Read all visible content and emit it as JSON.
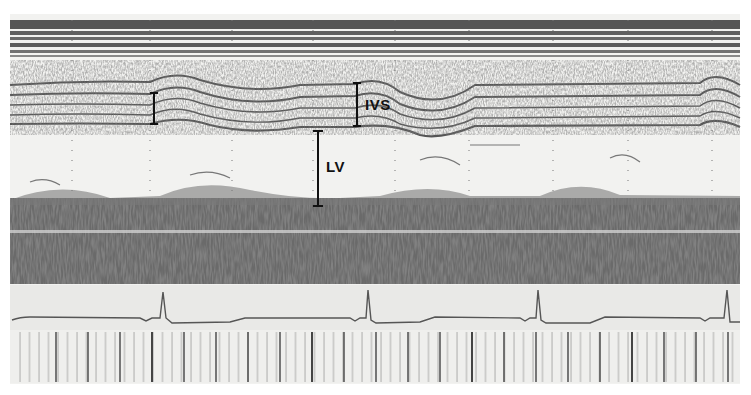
{
  "image": {
    "kind": "M-mode echocardiogram",
    "background": "#f2f2f0",
    "ink": "#3a3a3a"
  },
  "labels": {
    "ivs": "IVS",
    "lv": "LV"
  },
  "calipers": [
    {
      "name": "ivs-caliper-left",
      "x": 154,
      "y1": 93,
      "y2": 124
    },
    {
      "name": "ivs-caliper",
      "x": 357,
      "y1": 83,
      "y2": 126
    },
    {
      "name": "lv-caliper",
      "x": 318,
      "y1": 131,
      "y2": 206
    }
  ],
  "regions": {
    "near_field_bands": {
      "y1": 18,
      "y2": 58
    },
    "septum_echoes": {
      "y1": 60,
      "y2": 135
    },
    "lv_cavity": {
      "y1": 135,
      "y2": 195
    },
    "posterior_wall": {
      "y1": 195,
      "y2": 285
    },
    "ecg_strip": {
      "y1": 285,
      "y2": 330
    },
    "time_markers": {
      "y1": 330,
      "y2": 383
    }
  },
  "ecg": {
    "qrs_x": [
      163,
      368,
      538,
      727
    ]
  },
  "dotted_gridlines_x": [
    72,
    150,
    232,
    313,
    395,
    469,
    553,
    628,
    712
  ]
}
